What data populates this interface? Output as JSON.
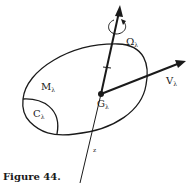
{
  "figure": {
    "caption": "Figure 44.",
    "labels": {
      "body_mass": {
        "main": "M",
        "sub": "λ"
      },
      "contact_region": {
        "main": "C",
        "sub": "λ"
      },
      "center": {
        "main": "G",
        "sub": "λ"
      },
      "velocity": {
        "main": "V",
        "sub": "λ"
      },
      "angular_velocity": {
        "main": "Ω",
        "sub": "λ"
      },
      "axis": "z"
    },
    "colors": {
      "ink": "#1a1a1a",
      "background": "#ffffff"
    }
  }
}
